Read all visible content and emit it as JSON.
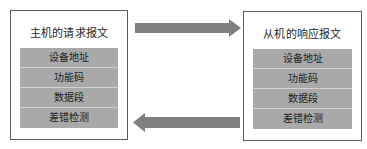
{
  "diagram": {
    "master": {
      "title": "主机的请求报文",
      "fields": [
        "设备地址",
        "功能码",
        "数据段",
        "差错检测"
      ]
    },
    "slave": {
      "title": "从机的响应报文",
      "fields": [
        "设备地址",
        "功能码",
        "数据段",
        "差错检测"
      ]
    },
    "arrows": [
      {
        "direction": "right",
        "from": "master",
        "to": "slave",
        "icon": "arrow-right-icon"
      },
      {
        "direction": "left",
        "from": "slave",
        "to": "master",
        "icon": "arrow-left-icon"
      }
    ],
    "colors": {
      "field_fill": "#a9a9a9",
      "field_separator": "#d2d2d2",
      "arrow_fill": "#7f7f7f",
      "border": "#5a5a5a"
    }
  }
}
